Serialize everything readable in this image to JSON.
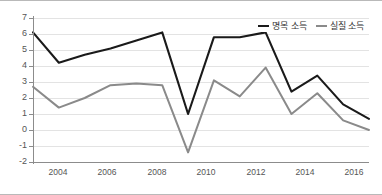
{
  "chart_data": {
    "type": "line",
    "title": "",
    "xlabel": "",
    "ylabel": "",
    "x": [
      2003,
      2004,
      2005,
      2006,
      2007,
      2008,
      2009,
      2010,
      2011,
      2012,
      2013,
      2014,
      2015,
      2016
    ],
    "xtick_labels": [
      "2004",
      "2006",
      "2008",
      "2010",
      "2012",
      "2014",
      "2016"
    ],
    "xtick_values": [
      2004,
      2006,
      2008,
      2010,
      2012,
      2014,
      2016
    ],
    "ytick_labels": [
      "7",
      "6",
      "5",
      "4",
      "3",
      "2",
      "1",
      "0",
      "-1",
      "-2"
    ],
    "ytick_values": [
      7,
      6,
      5,
      4,
      3,
      2,
      1,
      0,
      -1,
      -2
    ],
    "ylim": [
      -2,
      7
    ],
    "xlim": [
      2003,
      2016
    ],
    "grid": true,
    "legend_position": "top-right",
    "series": [
      {
        "name": "명목 소득",
        "color": "#1a1a1a",
        "values": [
          6.1,
          4.2,
          4.7,
          5.1,
          5.6,
          6.1,
          1.0,
          5.8,
          5.8,
          6.1,
          2.4,
          3.4,
          1.6,
          0.7
        ]
      },
      {
        "name": "실질 소득",
        "color": "#8a8a8a",
        "values": [
          2.7,
          1.4,
          2.0,
          2.8,
          2.9,
          2.8,
          -1.4,
          3.1,
          2.1,
          3.9,
          1.0,
          2.3,
          0.6,
          0.0
        ]
      }
    ]
  },
  "legend": {
    "entries": [
      {
        "label": "명목 소득",
        "color": "#1a1a1a"
      },
      {
        "label": "실질 소득",
        "color": "#8a8a8a"
      }
    ]
  },
  "axes": {
    "y_labels": [
      "7",
      "6",
      "5",
      "4",
      "3",
      "2",
      "1",
      "0",
      "-1",
      "-2"
    ],
    "x_labels": [
      "2004",
      "2006",
      "2008",
      "2010",
      "2012",
      "2014",
      "2016"
    ]
  }
}
